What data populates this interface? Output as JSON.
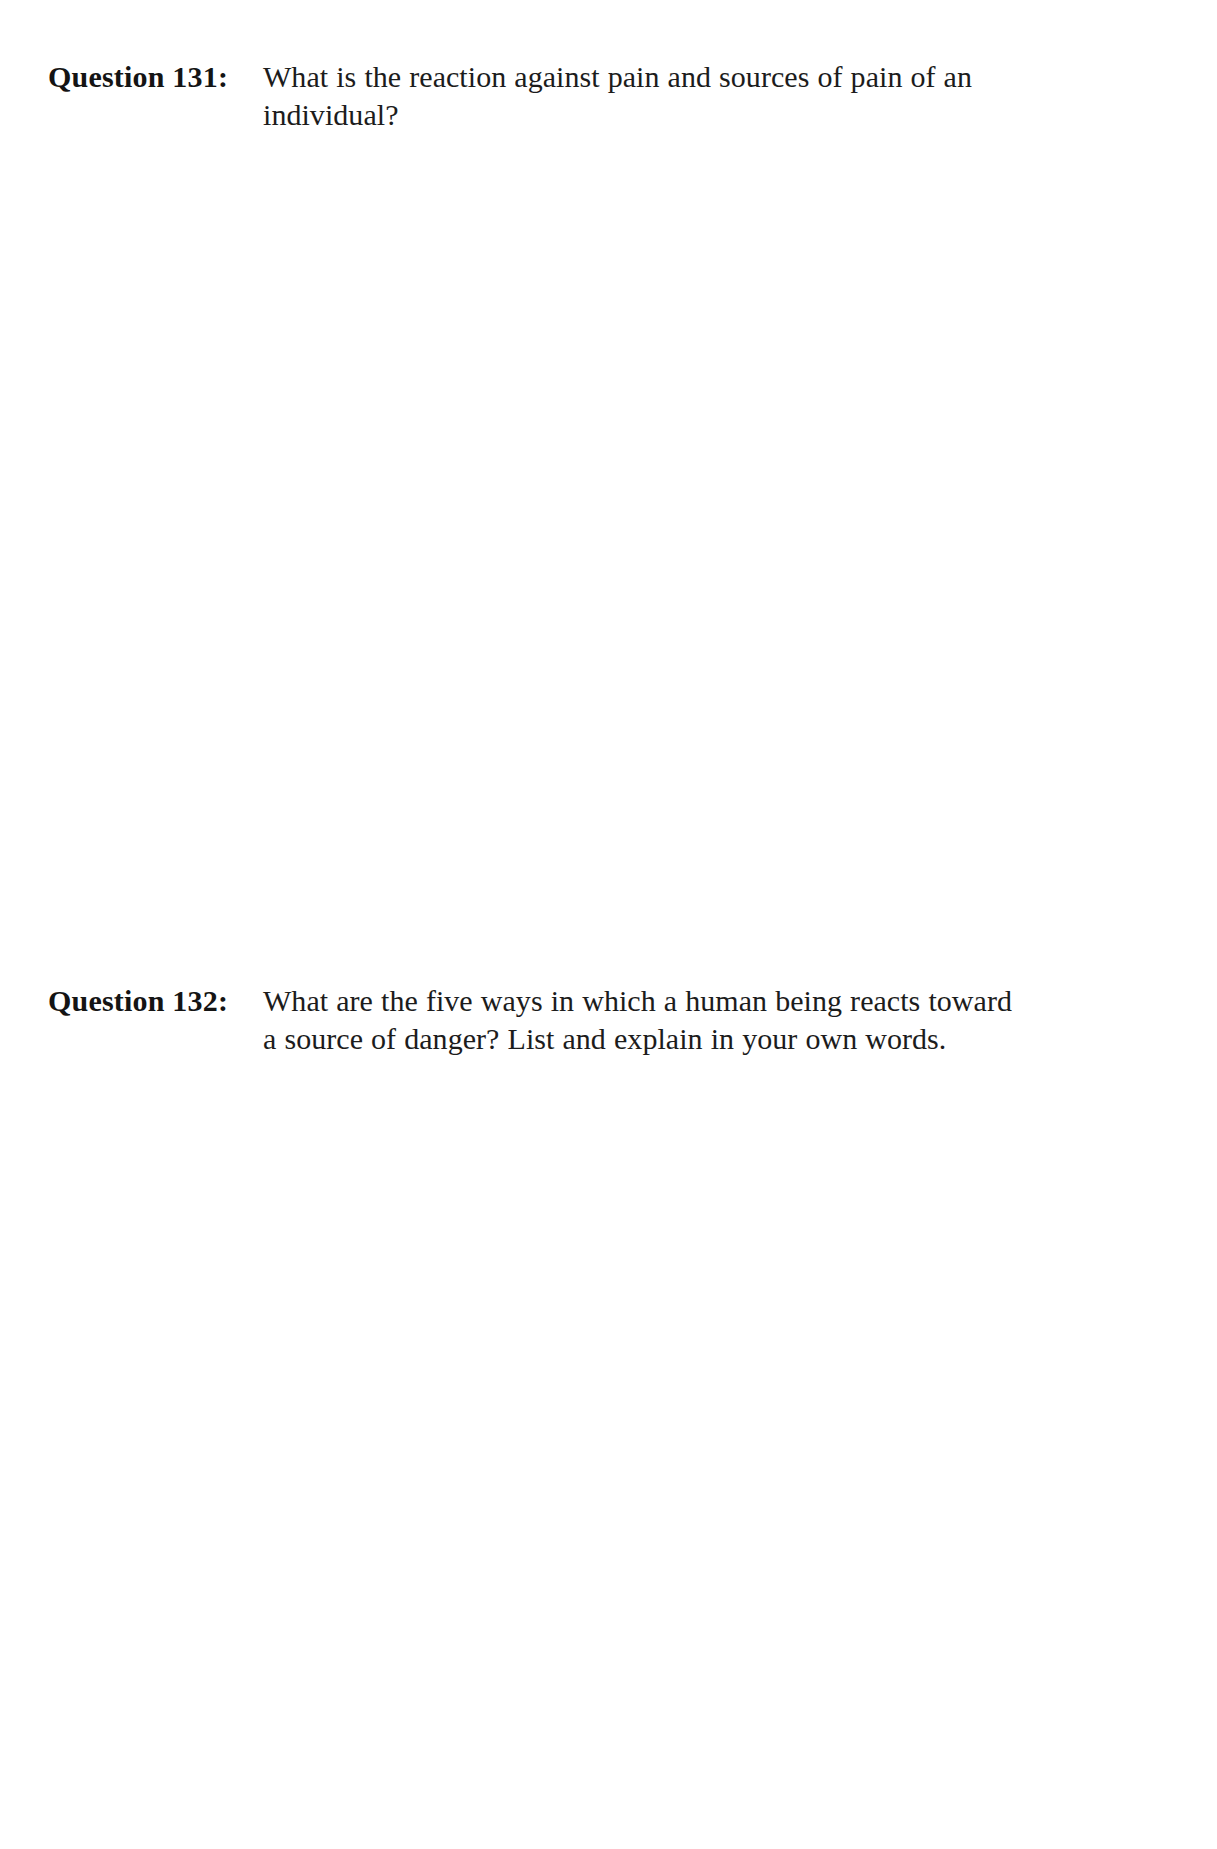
{
  "page": {
    "background_color": "#ffffff",
    "text_color": "#1a1a1a",
    "width": 1217,
    "height": 1849
  },
  "questions": [
    {
      "label": "Question 131:",
      "number": "131",
      "lines": [
        "What is the reaction against pain and sources of pain of an",
        "individual?"
      ],
      "full_text": "What is the reaction against pain and sources of pain of an individual?"
    },
    {
      "label": "Question 132:",
      "number": "132",
      "lines": [
        "What are the five ways in which a human being reacts toward",
        "a source of danger? List and explain in your own words."
      ],
      "full_text": "What are the five ways in which a human being reacts toward a source of danger? List and explain in your own words."
    }
  ]
}
